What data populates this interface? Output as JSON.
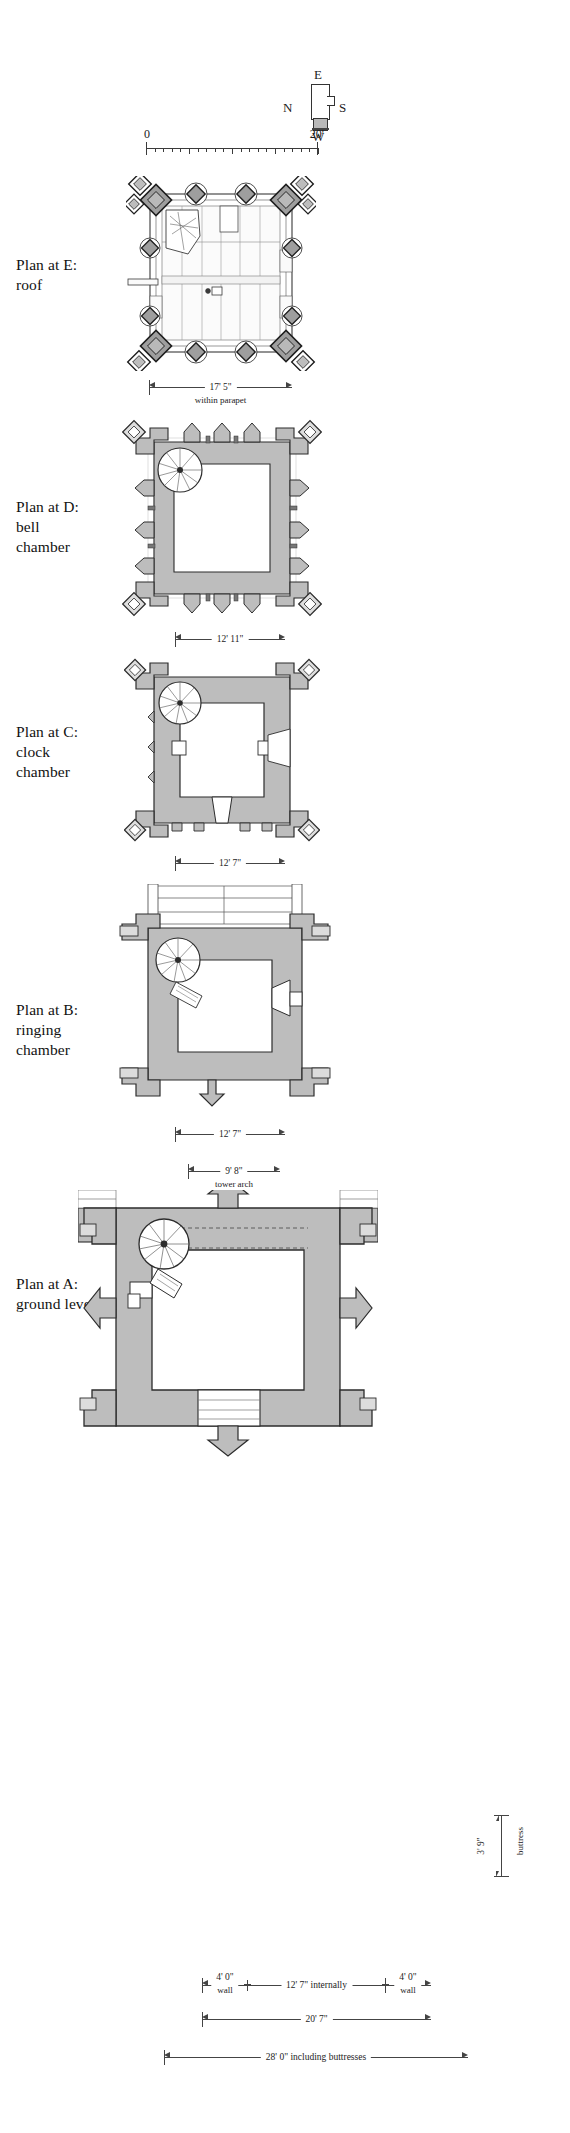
{
  "sheet": {
    "title": "Church tower floor plans",
    "background": "#ffffff",
    "ink": "#1a1a1a",
    "wall_fill": "#bdbdbd",
    "stone_fill": "#9a9a9a"
  },
  "compass": {
    "name": "compass-rose",
    "north": "N",
    "east": "E",
    "south": "S",
    "west": "W"
  },
  "scale_bar": {
    "zero": "0",
    "max": "20'",
    "units": "feet",
    "minor_ticks": 20
  },
  "plans": [
    {
      "id": "E",
      "label": "Plan at E:\nroof",
      "level_letter": "E",
      "level_name": "roof",
      "dimensions": [
        {
          "value": "17' 5\"",
          "note": "within parapet",
          "axis": "horizontal"
        }
      ]
    },
    {
      "id": "D",
      "label": "Plan at D:\nbell\nchamber",
      "level_letter": "D",
      "level_name": "bell chamber",
      "dimensions": [
        {
          "value": "12' 11\"",
          "note": "",
          "axis": "horizontal"
        }
      ]
    },
    {
      "id": "C",
      "label": "Plan at C:\nclock\nchamber",
      "level_letter": "C",
      "level_name": "clock chamber",
      "dimensions": [
        {
          "value": "12' 7\"",
          "note": "",
          "axis": "horizontal"
        }
      ]
    },
    {
      "id": "B",
      "label": "Plan at B:\nringing\nchamber",
      "level_letter": "B",
      "level_name": "ringing chamber",
      "dimensions": [
        {
          "value": "12' 7\"",
          "note": "",
          "axis": "horizontal"
        }
      ]
    },
    {
      "id": "A",
      "label": "Plan at A:\nground level",
      "level_letter": "A",
      "level_name": "ground level",
      "dimensions": [
        {
          "value": "9' 8\"",
          "note": "tower arch",
          "axis": "horizontal"
        },
        {
          "value": "4' 0\"",
          "note": "wall",
          "axis": "horizontal"
        },
        {
          "value": "12' 7\" internally",
          "note": "",
          "axis": "horizontal"
        },
        {
          "value": "20' 7\"",
          "note": "",
          "axis": "horizontal"
        },
        {
          "value": "28' 0\" including buttresses",
          "note": "",
          "axis": "horizontal"
        },
        {
          "value": "3' 9\"",
          "note": "buttress",
          "axis": "vertical"
        }
      ]
    }
  ],
  "labels": {
    "plan_e": "Plan at E:\nroof",
    "plan_d": "Plan at D:\nbell\nchamber",
    "plan_c": "Plan at C:\nclock\nchamber",
    "plan_b": "Plan at B:\nringing\nchamber",
    "plan_a": "Plan at A:\nground level"
  },
  "dims": {
    "e_main": "17' 5\"",
    "e_note": "within parapet",
    "d_main": "12' 11\"",
    "c_main": "12' 7\"",
    "b_main": "12' 7\"",
    "a_arch": "9' 8\"",
    "a_arch_note": "tower arch",
    "a_wall_left": "4' 0\"",
    "a_wall_left_note": "wall",
    "a_internal": "12' 7\" internally",
    "a_wall_right": "4' 0\"",
    "a_wall_right_note": "wall",
    "a_overall": "20' 7\"",
    "a_buttresses": "28' 0\" including buttresses",
    "a_buttress_depth": "3' 9\"",
    "a_buttress_depth_note": "buttress"
  }
}
